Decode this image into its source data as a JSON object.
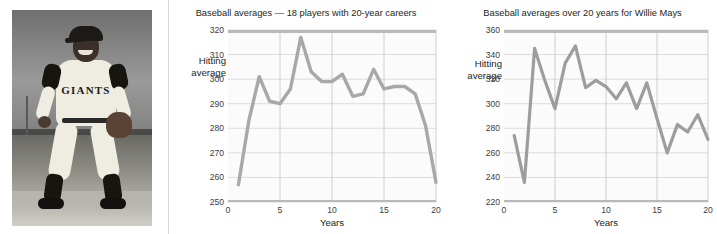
{
  "photo": {
    "credit": "Bettmann/Corbis",
    "jersey_text": "GIANTS",
    "alt": "Willie Mays in Giants uniform crouching in fielding stance"
  },
  "charts": [
    {
      "title": "Baseball averages — 18 players with 20-year careers",
      "ylabel": "Hitting\naverage",
      "xlabel": "Years",
      "yticks": [
        250,
        260,
        270,
        280,
        290,
        300,
        310,
        320
      ],
      "xticks": [
        0,
        5,
        10,
        15,
        20
      ]
    },
    {
      "title": "Baseball averages over 20 years for Willie Mays",
      "ylabel": "Hitting\naverage",
      "xlabel": "Years",
      "yticks": [
        220,
        240,
        260,
        280,
        300,
        320,
        340,
        360
      ],
      "xticks": [
        0,
        5,
        10,
        15,
        20
      ]
    }
  ],
  "chart_data": [
    {
      "type": "line",
      "title": "Baseball averages — 18 players with 20-year careers",
      "xlabel": "Years",
      "ylabel": "Hitting average",
      "xlim": [
        0,
        20
      ],
      "ylim": [
        250,
        320
      ],
      "grid": true,
      "legend": "none",
      "line_color": "#a8a8a8",
      "x": [
        1,
        2,
        3,
        4,
        5,
        6,
        7,
        8,
        9,
        10,
        11,
        12,
        13,
        14,
        15,
        16,
        17,
        18,
        19,
        20
      ],
      "values": [
        257,
        283,
        301,
        291,
        290,
        296,
        317,
        303,
        299,
        299,
        302,
        293,
        294,
        304,
        296,
        297,
        297,
        294,
        281,
        258
      ],
      "series": [
        {
          "name": "Average of 18 players with 20-year careers",
          "values": [
            257,
            283,
            301,
            291,
            290,
            296,
            317,
            303,
            299,
            299,
            302,
            293,
            294,
            304,
            296,
            297,
            297,
            294,
            281,
            258
          ]
        }
      ]
    },
    {
      "type": "line",
      "title": "Baseball averages over 20 years for Willie Mays",
      "xlabel": "Years",
      "ylabel": "Hitting average",
      "xlim": [
        0,
        20
      ],
      "ylim": [
        220,
        360
      ],
      "grid": true,
      "legend": "none",
      "line_color": "#9d9d9d",
      "x": [
        1,
        2,
        3,
        4,
        5,
        6,
        7,
        8,
        9,
        10,
        11,
        12,
        13,
        14,
        15,
        16,
        17,
        18,
        19,
        20
      ],
      "values": [
        274,
        236,
        345,
        319,
        296,
        333,
        347,
        313,
        319,
        314,
        304,
        317,
        296,
        317,
        288,
        260,
        283,
        277,
        291,
        271
      ],
      "series": [
        {
          "name": "Willie Mays",
          "values": [
            274,
            236,
            345,
            319,
            296,
            333,
            347,
            313,
            319,
            314,
            304,
            317,
            296,
            317,
            288,
            260,
            283,
            277,
            291,
            271
          ]
        }
      ]
    }
  ]
}
